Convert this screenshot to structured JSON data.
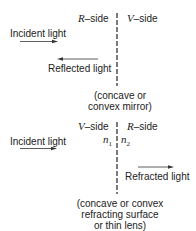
{
  "mirror_panel": {
    "left_side_letter": "R",
    "left_side_suffix": "–side",
    "right_side_letter": "V",
    "right_side_suffix": "–side",
    "incident_label": "Incident light",
    "reflected_label": "Reflected light",
    "caption_line1": "(concave or",
    "caption_line2": "convex mirror)"
  },
  "refraction_panel": {
    "left_side_letter": "V",
    "left_side_suffix": "–side",
    "right_side_letter": "R",
    "right_side_suffix": "–side",
    "n1_base": "n",
    "n1_sub": "1",
    "n2_base": "n",
    "n2_sub": "2",
    "incident_label": "Incident light",
    "refracted_label": "Refracted light",
    "caption_line1": "(concave or convex",
    "caption_line2": "refracting surface",
    "caption_line3": "or thin lens)"
  },
  "colors": {
    "ink": "#222222",
    "background": "#ffffff"
  }
}
